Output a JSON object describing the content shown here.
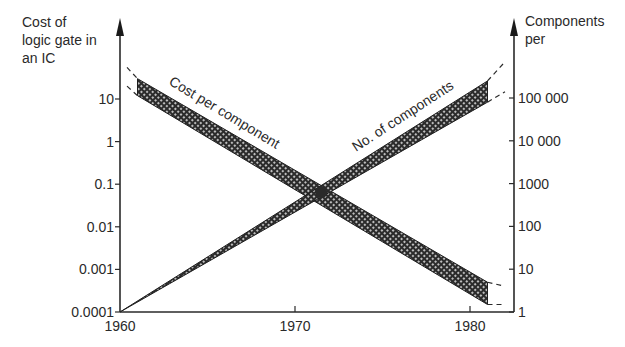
{
  "chart_data": {
    "type": "line",
    "title": "",
    "xlabel": "",
    "x_ticks": [
      "1960",
      "1970",
      "1980"
    ],
    "x_tick_values": [
      1960,
      1970,
      1980
    ],
    "xlim": [
      1960,
      1982
    ],
    "left_axis": {
      "label_lines": [
        "Cost of",
        "logic gate in",
        "an IC"
      ],
      "scale": "log",
      "ylim": [
        0.0001,
        10
      ],
      "tick_values": [
        10,
        1,
        0.1,
        0.01,
        0.001,
        0.0001
      ],
      "tick_labels": [
        "10",
        "1",
        "0.1",
        "0.01",
        "0.001",
        "0.0001"
      ]
    },
    "right_axis": {
      "label_lines": [
        "Components",
        "per"
      ],
      "scale": "log",
      "ylim": [
        1,
        100000
      ],
      "tick_values": [
        100000,
        10000,
        1000,
        100,
        10,
        1
      ],
      "tick_labels": [
        "100 000",
        "10 000",
        "1000",
        "100",
        "10",
        "1"
      ]
    },
    "series": [
      {
        "name": "Cost per component",
        "axis": "left",
        "style": "hatched-band",
        "x": [
          1961,
          1981
        ],
        "upper": [
          30,
          0.0005
        ],
        "lower": [
          12,
          0.00015
        ],
        "dashed_extension": {
          "x": [
            1960.4,
            1982
          ],
          "upper": [
            55,
            0.0004
          ],
          "lower": [
            20,
            0.00015
          ]
        }
      },
      {
        "name": "No. of components",
        "axis": "right",
        "style": "hatched-band",
        "x": [
          1960,
          1981
        ],
        "upper": [
          1,
          250000
        ],
        "lower": [
          1,
          80000
        ],
        "dashed_extension": {
          "x": [
            1980.5,
            1982
          ],
          "upper": [
            400000,
            700000
          ],
          "lower": [
            100000,
            140000
          ]
        }
      }
    ],
    "annotations": [
      {
        "text": "Cost per component",
        "near_series": "Cost per component"
      },
      {
        "text": "No. of components",
        "near_series": "No. of components"
      },
      {
        "text": "intersection",
        "x": 1971.5,
        "left_value": 0.065,
        "right_value": 700
      }
    ],
    "grid": false,
    "legend": "none"
  }
}
